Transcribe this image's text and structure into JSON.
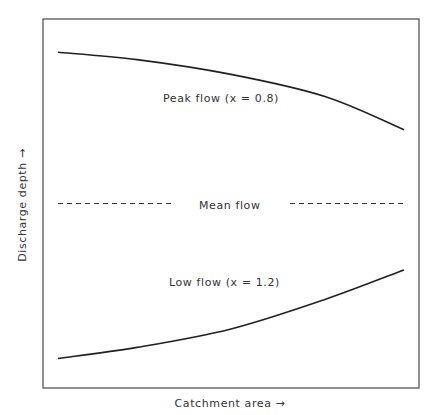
{
  "chart_data": {
    "type": "line",
    "title": "",
    "xlabel": "Catchment area →",
    "ylabel": "Discharge depth →",
    "xlim": [
      0,
      1
    ],
    "ylim": [
      0,
      1
    ],
    "grid": false,
    "legend": "none (inline curve labels)",
    "axis_ticks": "none",
    "values_note": "normalized 0-1, estimated from pixel positions; the chart has no numeric scale",
    "series": [
      {
        "name": "Peak flow (x = 0.8)",
        "style": "solid",
        "x": [
          0.04,
          0.25,
          0.5,
          0.75,
          0.96
        ],
        "y": [
          0.91,
          0.89,
          0.85,
          0.79,
          0.7
        ]
      },
      {
        "name": "Mean flow",
        "style": "dashed",
        "x": [
          0.04,
          0.96
        ],
        "y": [
          0.5,
          0.5
        ]
      },
      {
        "name": "Low flow (x = 1.2)",
        "style": "solid",
        "x": [
          0.04,
          0.25,
          0.5,
          0.75,
          0.96
        ],
        "y": [
          0.08,
          0.11,
          0.16,
          0.24,
          0.32
        ]
      }
    ],
    "annotations": [
      {
        "text": "Peak flow (x = 0.8)",
        "near": "peak curve, center"
      },
      {
        "text": "Mean flow",
        "near": "dashed line, center gap"
      },
      {
        "text": "Low flow (x = 1.2)",
        "near": "low curve, center"
      }
    ]
  },
  "labels": {
    "peak": "Peak flow (x = 0.8)",
    "mean": "Mean flow",
    "low": "Low flow (x = 1.2)",
    "xaxis": "Catchment area →",
    "yaxis": "Discharge depth →"
  }
}
